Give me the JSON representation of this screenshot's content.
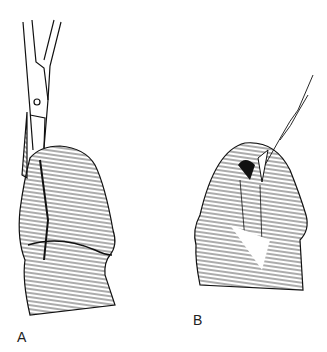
{
  "figure": {
    "panels": [
      {
        "id": "A",
        "label": "A",
        "description": "Scissors incising dorsal foreskin of glans"
      },
      {
        "id": "B",
        "label": "B",
        "description": "Suture placed at apex of dorsal slit"
      }
    ],
    "colors": {
      "ink": "#111111",
      "background": "#ffffff"
    }
  }
}
